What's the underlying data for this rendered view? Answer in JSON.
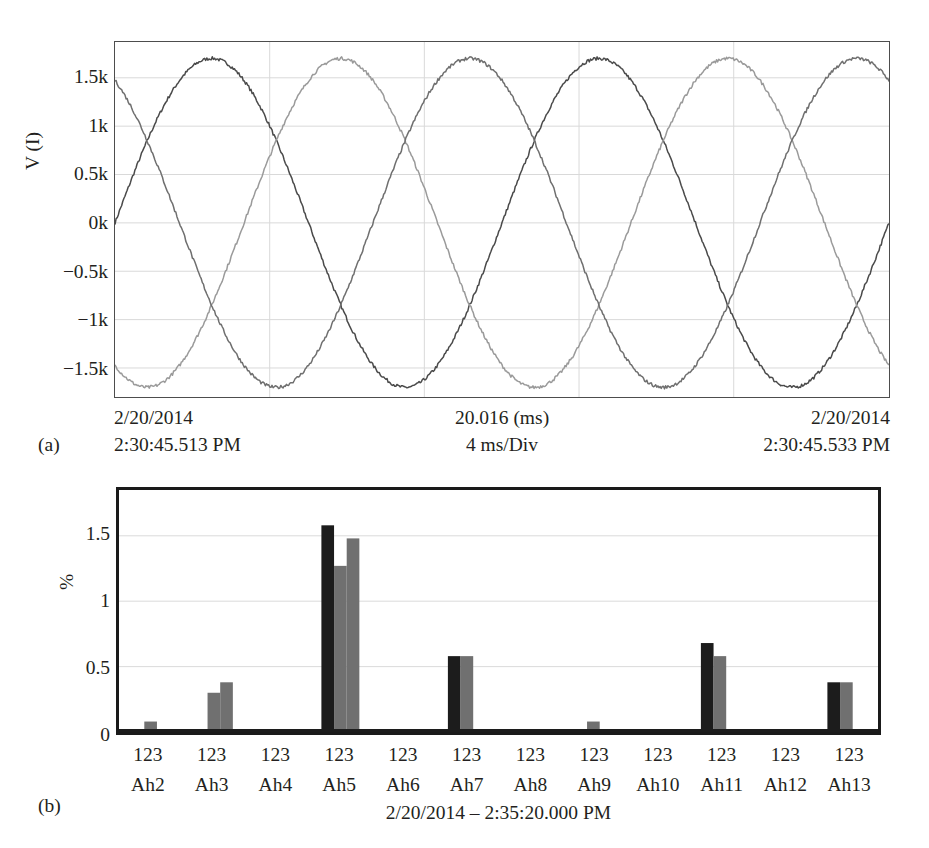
{
  "figure": {
    "subfigure_a_label": "(a)",
    "subfigure_b_label": "(b)"
  },
  "scope": {
    "ylabel": "V (I)",
    "yticks": [
      "1.5k",
      "1k",
      "0.5k",
      "0k",
      "−0.5k",
      "−1k",
      "−1.5k"
    ],
    "xaxis": {
      "left_date": "2/20/2014",
      "left_time": "2:30:45.513 PM",
      "center_span": "20.016 (ms)",
      "center_scale": "4 ms/Div",
      "right_date": "2/20/2014",
      "right_time": "2:30:45.533 PM"
    }
  },
  "harmonics": {
    "ylabel": "%",
    "yticks": [
      "1.5",
      "1",
      "0.5",
      "0"
    ],
    "caption": "2/20/2014 – 2:35:20.000 PM",
    "value_row_label": "123"
  },
  "colors": {
    "trace_dark": "#4a4a4a",
    "trace_mid": "#6f6f6f",
    "trace_light": "#9a9a9a",
    "bar_black": "#1c1c1c",
    "bar_gray": "#707070",
    "grid": "#d9d9d9",
    "axis": "#4d4d4d",
    "text": "#231f20"
  },
  "chart_data": [
    {
      "type": "line",
      "title": "",
      "subtitle": "",
      "xlabel": "20.016 (ms)  /  4 ms/Div",
      "ylabel": "V (I)",
      "ylim": [
        -1800,
        1870
      ],
      "xlim": [
        0,
        20.016
      ],
      "ytick_values": [
        1500,
        1000,
        500,
        0,
        -500,
        -1000,
        -1500
      ],
      "ytick_labels": [
        "1.5k",
        "1k",
        "0.5k",
        "0k",
        "−0.5k",
        "−1k",
        "−1.5k"
      ],
      "xtick_values": [
        0,
        4,
        8,
        12,
        16,
        20.016
      ],
      "grid": true,
      "legend": "none",
      "units": "V",
      "time_unit": "ms",
      "cycles_shown": 2,
      "amplitude_peak": 1700,
      "series": [
        {
          "name": "Phase A",
          "color": "#4a4a4a",
          "phase_deg": 0,
          "start_value": 0,
          "peak": 1700,
          "cycles": 2
        },
        {
          "name": "Phase B",
          "color": "#9a9a9a",
          "phase_deg": -120,
          "start_value": -1470,
          "peak": 1700,
          "cycles": 2
        },
        {
          "name": "Phase C",
          "color": "#6f6f6f",
          "phase_deg": 120,
          "start_value": 1470,
          "peak": 1700,
          "cycles": 2
        }
      ],
      "annotations": [
        "2/20/2014 2:30:45.513 PM",
        "20.016 (ms) / 4 ms/Div",
        "2/20/2014 2:30:45.533 PM"
      ]
    },
    {
      "type": "bar",
      "title": "",
      "xlabel": "2/20/2014 – 2:35:20.000 PM",
      "ylabel": "%",
      "ylim": [
        0,
        1.85
      ],
      "ytick_values": [
        0,
        0.5,
        1,
        1.5
      ],
      "ytick_labels": [
        "0",
        "0.5",
        "1",
        "1.5"
      ],
      "grid": true,
      "legend": "none",
      "categories": [
        "Ah2",
        "Ah3",
        "Ah4",
        "Ah5",
        "Ah6",
        "Ah7",
        "Ah8",
        "Ah9",
        "Ah10",
        "Ah11",
        "Ah12",
        "Ah13"
      ],
      "category_value_labels": [
        "123",
        "123",
        "123",
        "123",
        "123",
        "123",
        "123",
        "123",
        "123",
        "123",
        "123",
        "123"
      ],
      "series": [
        {
          "name": "Series 1",
          "color": "#1c1c1c",
          "values": [
            0.0,
            0.0,
            0.0,
            1.58,
            0.0,
            0.58,
            0.0,
            0.0,
            0.0,
            0.68,
            0.0,
            0.38
          ]
        },
        {
          "name": "Series 2",
          "color": "#707070",
          "values": [
            0.08,
            0.3,
            0.0,
            1.27,
            0.0,
            0.58,
            0.0,
            0.08,
            0.0,
            0.58,
            0.0,
            0.38
          ]
        },
        {
          "name": "Series 3",
          "color": "#707070",
          "values": [
            0.0,
            0.38,
            0.0,
            1.48,
            0.0,
            0.0,
            0.0,
            0.0,
            0.0,
            0.0,
            0.0,
            0.0
          ]
        }
      ]
    }
  ]
}
